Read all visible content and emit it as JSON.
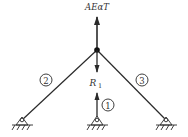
{
  "diagram": {
    "title": "",
    "colors": {
      "line": "#2a2a2a",
      "text": "#333333",
      "background": "#ffffff"
    },
    "labels": {
      "top_force": "AEαT",
      "reaction": "R",
      "reaction_subscript": "1"
    },
    "members": [
      {
        "id": "1",
        "label": "1",
        "description": "vertical member from node to center support"
      },
      {
        "id": "2",
        "label": "2",
        "description": "inclined member to left support"
      },
      {
        "id": "3",
        "label": "3",
        "description": "inclined member to right support"
      }
    ],
    "supports": [
      {
        "position": "left",
        "type": "pin"
      },
      {
        "position": "center",
        "type": "pin"
      },
      {
        "position": "right",
        "type": "pin"
      }
    ],
    "node": {
      "type": "joint"
    }
  }
}
